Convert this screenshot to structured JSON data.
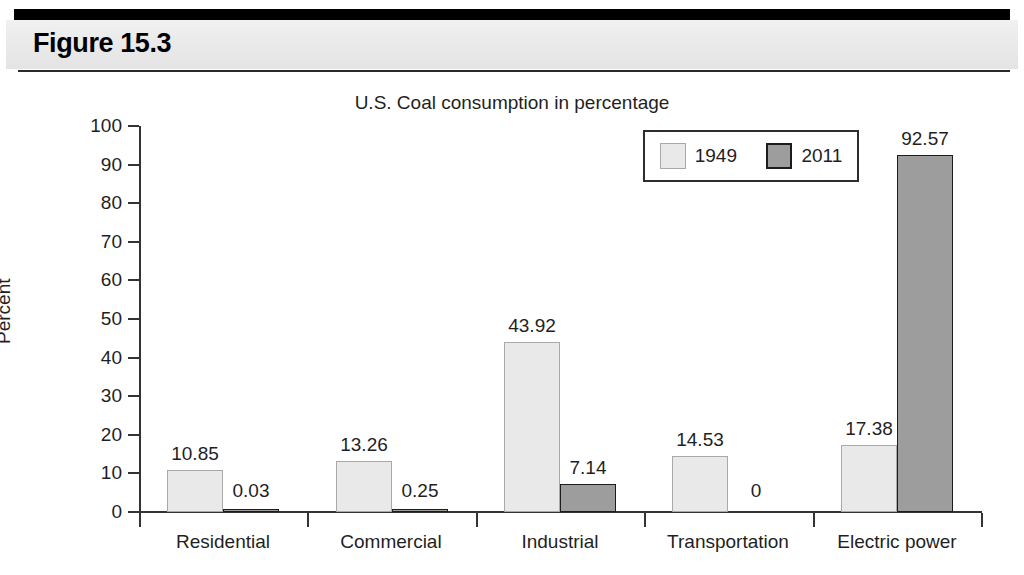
{
  "figure": {
    "label": "Figure 15.3"
  },
  "chart_data": {
    "type": "bar",
    "title": "U.S. Coal consumption in percentage",
    "xlabel": "",
    "ylabel": "Percent",
    "ylim": [
      0,
      100
    ],
    "ytick_step": 10,
    "yticks": [
      "100",
      "90",
      "80",
      "70",
      "60",
      "50",
      "40",
      "30",
      "20",
      "10",
      "0"
    ],
    "grid": false,
    "legend_position": "upper right",
    "categories": [
      "Residential",
      "Commercial",
      "Industrial",
      "Transportation",
      "Electric power"
    ],
    "series": [
      {
        "name": "1949",
        "color": "#e9e9e9",
        "border_color": "#a9a9a9",
        "values": [
          10.85,
          13.26,
          43.92,
          14.53,
          17.38
        ],
        "labels": [
          "10.85",
          "13.26",
          "43.92",
          "14.53",
          "17.38"
        ]
      },
      {
        "name": "2011",
        "color": "#9d9d9d",
        "border_color": "#1c1c1c",
        "values": [
          0.03,
          0.25,
          7.14,
          0,
          92.57
        ],
        "labels": [
          "0.03",
          "0.25",
          "7.14",
          "0",
          "92.57"
        ]
      }
    ]
  }
}
